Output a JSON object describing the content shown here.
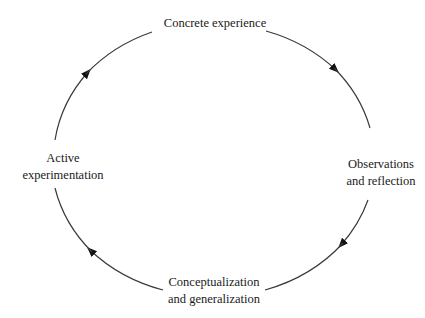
{
  "diagram": {
    "type": "cycle",
    "direction": "clockwise",
    "stroke_color": "#3a3a3a",
    "arrow_color": "#111111",
    "nodes": [
      {
        "id": "top",
        "lines": [
          "Concrete experience"
        ]
      },
      {
        "id": "right",
        "lines": [
          "Observations",
          "and reflection"
        ]
      },
      {
        "id": "bottom",
        "lines": [
          "Conceptualization",
          "and generalization"
        ]
      },
      {
        "id": "left",
        "lines": [
          "Active",
          "experimentation"
        ]
      }
    ],
    "edges": [
      {
        "from": "top",
        "to": "right"
      },
      {
        "from": "right",
        "to": "bottom"
      },
      {
        "from": "bottom",
        "to": "left"
      },
      {
        "from": "left",
        "to": "top"
      }
    ]
  }
}
